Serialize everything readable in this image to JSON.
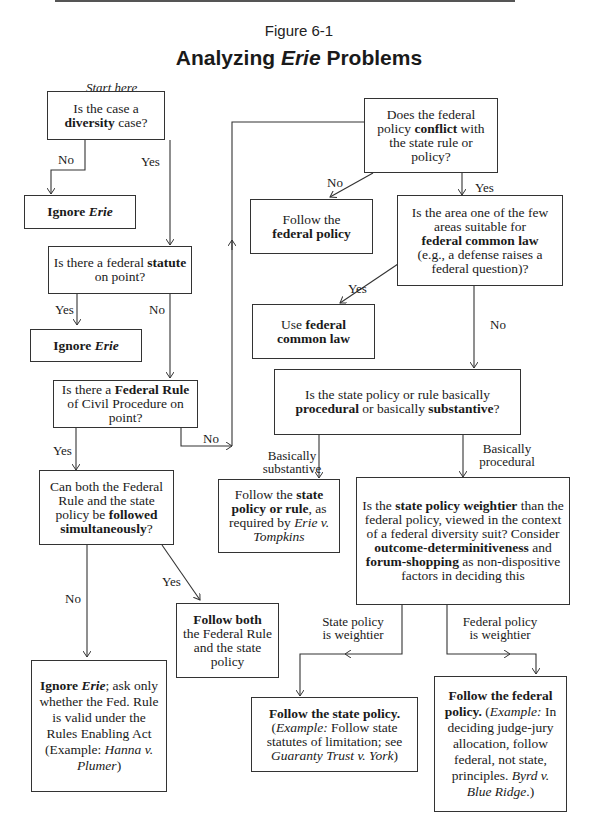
{
  "figure": {
    "label": "Figure 6-1",
    "title_prefix": "Analyzing ",
    "title_italic": "Erie",
    "title_suffix": " Problems",
    "start_label": "Start here"
  },
  "nodes": {
    "diversity": {
      "pre": "Is the case a ",
      "bold": "diversity",
      "post": " case?"
    },
    "ignore_erie_1": {
      "bold": "Ignore ",
      "italic": "Erie"
    },
    "statute": {
      "pre": "Is there a federal ",
      "bold": "statute",
      "post": " on point?"
    },
    "ignore_erie_2": {
      "bold": "Ignore ",
      "italic": "Erie"
    },
    "frcp": {
      "pre": "Is there a ",
      "bold": "Federal Rule",
      "post": " of Civil Procedure on point?"
    },
    "both": {
      "pre": "Can both the Federal Rule and the state policy be ",
      "bold": "followed simultaneously",
      "post": "?"
    },
    "follow_both": {
      "bold": "Follow both",
      "post": "the Federal Rule and the state policy"
    },
    "ignore_erie_rea": {
      "bold": "Ignore ",
      "italic": "Erie",
      "post1": "; ask only whether the Fed. Rule is valid under the Rules Enabling Act (Example: ",
      "italic2": "Hanna v. Plumer",
      "post2": ")"
    },
    "conflict": {
      "pre": "Does the federal policy ",
      "bold": "conflict",
      "post": " with the state rule or policy?"
    },
    "follow_federal_policy": {
      "pre": "Follow the",
      "bold": "federal policy"
    },
    "common_law_q": {
      "pre": "Is the area one of the few areas suitable for",
      "bold": "federal common law",
      "post": "(e.g., a defense raises a federal question)?"
    },
    "use_common_law": {
      "pre": "Use ",
      "bold": "federal common law"
    },
    "proc_subst": {
      "pre": "Is the state policy or rule basically ",
      "bold1": "procedural",
      "mid": " or basically ",
      "bold2": "substantive",
      "post": "?"
    },
    "follow_state_rule": {
      "pre": "Follow the ",
      "bold": "state policy or rule",
      "mid": ", as required by ",
      "italic": "Erie v. Tompkins"
    },
    "weightier": {
      "pre": "Is the ",
      "bold1": "state policy weightier",
      "mid1": " than the federal policy, viewed in the context of a federal diversity suit? Consider ",
      "bold2": "outcome-determinitiveness",
      "mid2": " and ",
      "bold3": "forum-shopping",
      "post": " as non-dispositive factors in deciding this"
    },
    "follow_state_policy": {
      "bold": "Follow the state policy.",
      "italic1": "Example:",
      "mid": " Follow state statutes of limitation; see ",
      "italic2": "Guaranty Trust v. York"
    },
    "follow_federal_final": {
      "bold": "Follow the federal policy.",
      "italic1": "Example:",
      "mid": " In deciding judge-jury allocation, follow federal, not state, principles. ",
      "italic2": "Byrd v. Blue Ridge"
    }
  },
  "edges": {
    "diversity_no": "No",
    "diversity_yes": "Yes",
    "statute_yes": "Yes",
    "statute_no": "No",
    "frcp_yes": "Yes",
    "frcp_no": "No",
    "both_yes": "Yes",
    "both_no": "No",
    "conflict_no": "No",
    "conflict_yes": "Yes",
    "common_yes": "Yes",
    "common_no": "No",
    "subst": "Basically substantive",
    "proc": "Basically procedural",
    "state_weightier": "State policy is weightier",
    "federal_weightier": "Federal policy is weightier"
  }
}
